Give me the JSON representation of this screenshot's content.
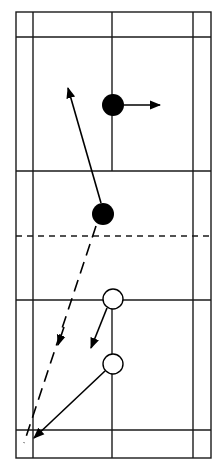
{
  "diagram": {
    "type": "badminton-court-tactics",
    "colors": {
      "line": "#1a1a1a",
      "background": "#ffffff",
      "player_a": "#000000",
      "player_b": "#ffffff"
    },
    "court": {
      "outer": {
        "x1": 16,
        "y1": 12,
        "x2": 211,
        "y2": 458
      },
      "singles_sidelines_x": [
        33,
        193
      ],
      "back_service_lines_y": [
        37,
        430
      ],
      "short_service_lines_y": [
        171,
        300
      ],
      "center_line_x": 112,
      "net_y": 236
    },
    "players": [
      {
        "id": "filled-top",
        "team": "A",
        "fill": "filled",
        "cx": 113,
        "cy": 105,
        "r": 11
      },
      {
        "id": "filled-mid",
        "team": "A",
        "fill": "filled",
        "cx": 103,
        "cy": 214,
        "r": 11
      },
      {
        "id": "hollow-top",
        "team": "B",
        "fill": "hollow",
        "cx": 113,
        "cy": 299,
        "r": 10
      },
      {
        "id": "hollow-bottom",
        "team": "B",
        "fill": "hollow",
        "cx": 113,
        "cy": 364,
        "r": 10
      }
    ],
    "arrows": [
      {
        "id": "filled-top-move",
        "style": "solid",
        "from": [
          124,
          105
        ],
        "to": [
          160,
          105
        ]
      },
      {
        "id": "filled-mid-move",
        "style": "solid",
        "from": [
          101,
          203
        ],
        "to": [
          68,
          88
        ]
      },
      {
        "id": "shuttle-path",
        "style": "dashed",
        "from": [
          96,
          226
        ],
        "to": [
          24,
          443
        ],
        "arrow_at": [
          60,
          340
        ]
      },
      {
        "id": "hollow-top-move",
        "style": "solid",
        "from": [
          107,
          308
        ],
        "to": [
          91,
          348
        ]
      },
      {
        "id": "hollow-bottom-move",
        "style": "solid",
        "from": [
          105,
          371
        ],
        "to": [
          34,
          438
        ]
      }
    ]
  }
}
